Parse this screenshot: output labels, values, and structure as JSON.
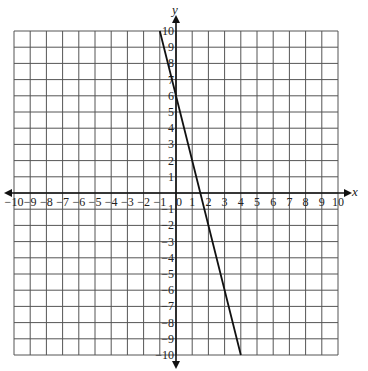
{
  "chart_data": {
    "type": "line",
    "title": "",
    "xlabel": "x",
    "ylabel": "y",
    "xlim": [
      -10,
      10
    ],
    "ylim": [
      -10,
      10
    ],
    "grid": true,
    "x_ticks": [
      -10,
      -9,
      -8,
      -7,
      -6,
      -5,
      -4,
      -3,
      -2,
      -1,
      0,
      1,
      2,
      3,
      4,
      5,
      6,
      7,
      8,
      9,
      10
    ],
    "y_ticks": [
      -10,
      -9,
      -8,
      -7,
      -6,
      -5,
      -4,
      -3,
      -2,
      -1,
      1,
      2,
      3,
      4,
      5,
      6,
      7,
      8,
      9,
      10
    ],
    "series": [
      {
        "name": "line",
        "equation": "y = -4x + 6",
        "points": [
          [
            -1,
            10
          ],
          [
            4,
            -10
          ]
        ]
      }
    ]
  },
  "labels": {
    "x_axis": "x",
    "y_axis": "y",
    "origin": "0"
  }
}
